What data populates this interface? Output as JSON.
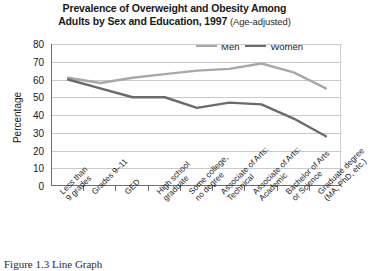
{
  "figure": {
    "title_line1": "Prevalence of Overweight and Obesity Among",
    "title_line2": "Adults by Sex and Education, 1997",
    "title_note": "(Age-adjusted)",
    "caption": "Figure 1.3 Line Graph"
  },
  "legend": {
    "position": "top-right",
    "items": [
      {
        "label": "Men",
        "color": "#a8a8a8"
      },
      {
        "label": "Women",
        "color": "#6b6b6b"
      }
    ]
  },
  "axes": {
    "y_title": "Percentage",
    "y_ticks": [
      "80",
      "70",
      "60",
      "50",
      "40",
      "30",
      "20",
      "10",
      "0"
    ],
    "y_tick_values": [
      80,
      70,
      60,
      50,
      40,
      30,
      20,
      10,
      0
    ]
  },
  "chart_data": {
    "type": "line",
    "title": "Prevalence of Overweight and Obesity Among Adults by Sex and Education, 1997 (Age-adjusted)",
    "xlabel": "",
    "ylabel": "Percentage",
    "ylim": [
      0,
      80
    ],
    "ytick_step": 10,
    "grid": true,
    "legend_position": "top-right",
    "categories": [
      "Less than 9 grades",
      "Grades 9–11",
      "GED",
      "High school graduate",
      "Some college, no degree",
      "Associate of Arts: Technical",
      "Associate of Arts: Academic",
      "Bachelor of Arts or Science",
      "Graduate degree (MA, PhD, etc.)"
    ],
    "category_lines": [
      [
        "Less than",
        "9 grades"
      ],
      [
        "Grades 9–11"
      ],
      [
        "GED"
      ],
      [
        "High school",
        "graduate"
      ],
      [
        "Some college,",
        "no degree"
      ],
      [
        "Associate of Arts:",
        "Technical"
      ],
      [
        "Associate of Arts:",
        "Academic"
      ],
      [
        "Bachelor of Arts",
        "or Science"
      ],
      [
        "Graduate degree",
        "(MA, PhD, etc.)"
      ]
    ],
    "series": [
      {
        "name": "Men",
        "color": "#a8a8a8",
        "values": [
          61,
          58,
          61,
          63,
          65,
          66,
          69,
          64,
          55
        ]
      },
      {
        "name": "Women",
        "color": "#6b6b6b",
        "values": [
          60,
          55,
          50,
          50,
          44,
          47,
          46,
          38,
          28
        ]
      }
    ]
  }
}
